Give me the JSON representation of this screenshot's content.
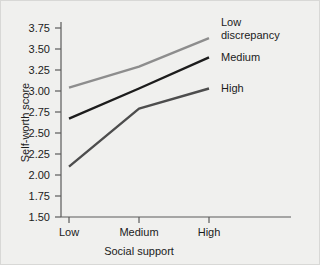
{
  "chart_data": {
    "type": "line",
    "title": "",
    "xlabel": "Social support",
    "ylabel": "Self-worth score",
    "categories": [
      "Low",
      "Medium",
      "High"
    ],
    "ylim": [
      1.5,
      3.75
    ],
    "ytick_labels": [
      "1.50",
      "1.75",
      "2.00",
      "2.25",
      "2.50",
      "2.75",
      "3.00",
      "3.25",
      "3.50",
      "3.75"
    ],
    "ytick_values": [
      1.5,
      1.75,
      2.0,
      2.25,
      2.5,
      2.75,
      3.0,
      3.25,
      3.5,
      3.75
    ],
    "grid": false,
    "legend_position": "right-inline",
    "series": [
      {
        "name": "Low discrepancy",
        "label_lines": [
          "Low",
          "discrepancy"
        ],
        "values": [
          3.04,
          3.29,
          3.63
        ],
        "color": "#8d8d8d"
      },
      {
        "name": "Medium",
        "label_lines": [
          "Medium"
        ],
        "values": [
          2.67,
          3.03,
          3.4
        ],
        "color": "#1c1c1c"
      },
      {
        "name": "High",
        "label_lines": [
          "High"
        ],
        "values": [
          2.1,
          2.79,
          3.03
        ],
        "color": "#4d4d4d"
      }
    ]
  },
  "figure": {
    "background_color": "#f0f0ee",
    "axis_color": "#5a5a5a"
  }
}
